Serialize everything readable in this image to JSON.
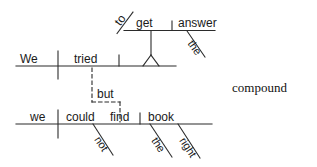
{
  "diagram": {
    "type": "reed-kellogg-sentence-diagram",
    "annotation_label": "compound",
    "clauses": [
      {
        "id": "clause-1",
        "words": [
          {
            "role": "subject",
            "text": "We"
          },
          {
            "role": "verb",
            "text": "tried"
          }
        ]
      },
      {
        "id": "infinitive-phrase",
        "words": [
          {
            "role": "infinitive-marker",
            "text": "to"
          },
          {
            "role": "infinitive-verb",
            "text": "get"
          },
          {
            "role": "direct-object",
            "text": "answer"
          },
          {
            "role": "article-modifier",
            "text": "the"
          }
        ]
      },
      {
        "id": "conjunction",
        "words": [
          {
            "role": "coordinating-conjunction",
            "text": "but"
          }
        ]
      },
      {
        "id": "clause-2",
        "words": [
          {
            "role": "subject",
            "text": "we"
          },
          {
            "role": "auxiliary-verb",
            "text": "could"
          },
          {
            "role": "verb",
            "text": "find"
          },
          {
            "role": "direct-object",
            "text": "book"
          },
          {
            "role": "adverb-modifier",
            "text": "not"
          },
          {
            "role": "article-modifier",
            "text": "the"
          },
          {
            "role": "adjective-modifier",
            "text": "right"
          }
        ]
      }
    ],
    "colors": {
      "line": "#2b2b2b",
      "text": "#1a1a1a",
      "background": "#ffffff"
    }
  }
}
